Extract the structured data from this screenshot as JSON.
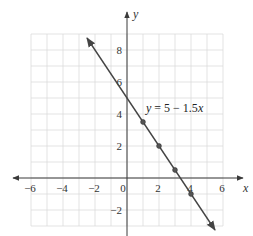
{
  "chart_data": {
    "type": "line",
    "title": "",
    "equation": "y = 5 − 1.5x",
    "xlabel": "x",
    "ylabel": "y",
    "xlim": [
      -6,
      6
    ],
    "ylim": [
      -3,
      9
    ],
    "grid": true,
    "x_ticks": [
      -6,
      -4,
      -2,
      0,
      2,
      4,
      6
    ],
    "y_ticks": [
      -2,
      2,
      4,
      6,
      8
    ],
    "tick_labels": {
      "x": [
        "−6",
        "−4",
        "−2",
        "0",
        "2",
        "4",
        "6"
      ],
      "y": [
        "−2",
        "2",
        "4",
        "6",
        "8"
      ]
    },
    "series": [
      {
        "name": "y = 5 − 1.5x",
        "slope": -1.5,
        "intercept": 5,
        "line_extent": [
          [
            -2.5,
            8.75
          ],
          [
            5.5,
            -3.25
          ]
        ],
        "points": [
          {
            "x": 1,
            "y": 3.5
          },
          {
            "x": 2,
            "y": 2
          },
          {
            "x": 3,
            "y": 0.5
          },
          {
            "x": 4,
            "y": -1
          }
        ]
      }
    ]
  },
  "labels": {
    "x_axis": "x",
    "y_axis": "y",
    "equation_var": "y",
    "equation_rest": " = 5 − 1.5",
    "equation_x": "x"
  }
}
